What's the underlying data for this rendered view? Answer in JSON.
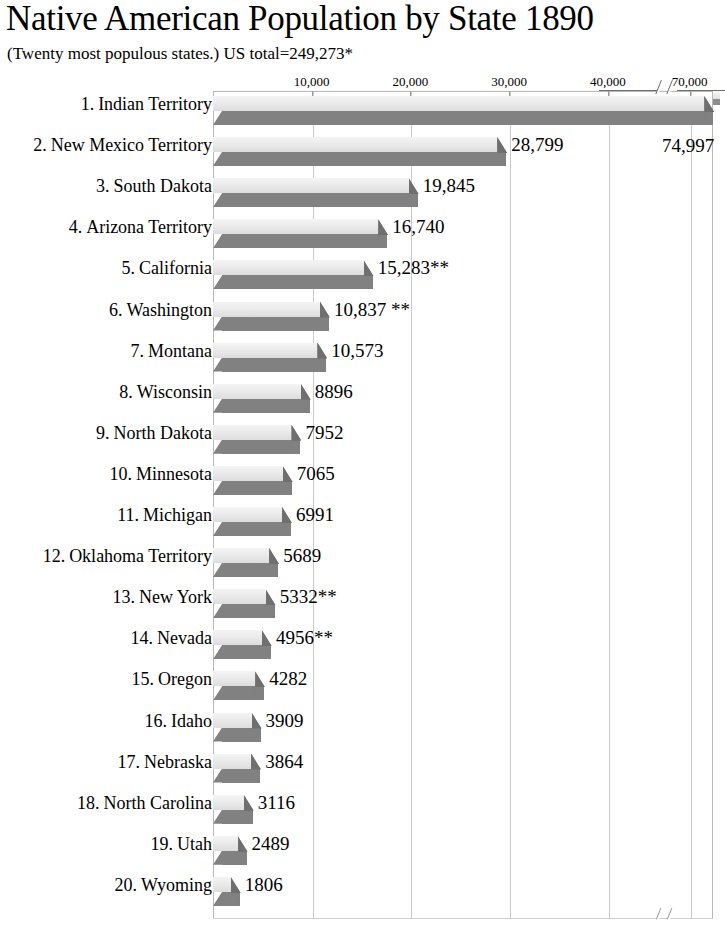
{
  "header": {
    "title": "Native American Population by State 1890",
    "subtitle": "(Twenty most populous states.) US total=249,273*"
  },
  "footnote": "",
  "axis": {
    "tick_labels": [
      "10,000",
      "20,000",
      "30,000",
      "40,000",
      "70,000"
    ],
    "break_present": true
  },
  "colors": {
    "bar_top": "#ebebeb",
    "bar_shadow": "#818181",
    "gridline": "#c9c9c9",
    "frame": "#b9b9b9",
    "text": "#000000"
  },
  "chart_data": {
    "type": "bar",
    "title": "Native American Population by State 1890",
    "subtitle": "(Twenty most populous states.) US total=249,273*",
    "orientation": "horizontal",
    "xlabel": "",
    "ylabel": "",
    "xlim": [
      0,
      80000
    ],
    "grid": true,
    "legend": "none",
    "axis_break": {
      "after": 45000,
      "before": 65000
    },
    "xticks": [
      10000,
      20000,
      30000,
      40000,
      70000
    ],
    "xticklabels": [
      "10,000",
      "20,000",
      "30,000",
      "40,000",
      "70,000"
    ],
    "categories": [
      "1. Indian Territory",
      "2. New Mexico Territory",
      "3. South Dakota",
      "4. Arizona Territory",
      "5. California",
      "6. Washington",
      "7. Montana",
      "8. Wisconsin",
      "9. North Dakota",
      "10. Minnesota",
      "11. Michigan",
      "12. Oklahoma Territory",
      "13. New York",
      "14. Nevada",
      "15. Oregon",
      "16. Idaho",
      "17. Nebraska",
      "18. North Carolina",
      "19. Utah",
      "20. Wyoming"
    ],
    "values": [
      74997,
      28799,
      19845,
      16740,
      15283,
      10837,
      10573,
      8896,
      7952,
      7065,
      6991,
      5689,
      5332,
      4956,
      4282,
      3909,
      3864,
      3116,
      2489,
      1806
    ],
    "value_labels": [
      "74,997",
      "28,799",
      "19,845",
      "16,740",
      "15,283**",
      "10,837 **",
      "10,573",
      "8896",
      "7952",
      "7065",
      "6991",
      "5689",
      "5332**",
      "4956**",
      "4282",
      "3909",
      "3864",
      "3116",
      "2489",
      "1806"
    ]
  },
  "rows": [
    {
      "rank": "1.",
      "state": "Indian Territory",
      "label": "1. Indian Territory",
      "value": 74997,
      "value_label": "74,997"
    },
    {
      "rank": "2.",
      "state": "New Mexico Territory",
      "label": "2. New Mexico Territory",
      "value": 28799,
      "value_label": "28,799"
    },
    {
      "rank": "3.",
      "state": "South Dakota",
      "label": "3. South Dakota",
      "value": 19845,
      "value_label": "19,845"
    },
    {
      "rank": "4.",
      "state": "Arizona Territory",
      "label": "4. Arizona Territory",
      "value": 16740,
      "value_label": "16,740"
    },
    {
      "rank": "5.",
      "state": "California",
      "label": "5. California",
      "value": 15283,
      "value_label": "15,283**"
    },
    {
      "rank": "6.",
      "state": "Washington",
      "label": "6. Washington",
      "value": 10837,
      "value_label": "10,837 **"
    },
    {
      "rank": "7.",
      "state": "Montana",
      "label": "7. Montana",
      "value": 10573,
      "value_label": "10,573"
    },
    {
      "rank": "8.",
      "state": "Wisconsin",
      "label": "8. Wisconsin",
      "value": 8896,
      "value_label": "8896"
    },
    {
      "rank": "9.",
      "state": "North Dakota",
      "label": "9. North Dakota",
      "value": 7952,
      "value_label": "7952"
    },
    {
      "rank": "10.",
      "state": "Minnesota",
      "label": "10. Minnesota",
      "value": 7065,
      "value_label": "7065"
    },
    {
      "rank": "11.",
      "state": "Michigan",
      "label": "11. Michigan",
      "value": 6991,
      "value_label": "6991"
    },
    {
      "rank": "12.",
      "state": "Oklahoma Territory",
      "label": "12. Oklahoma Territory",
      "value": 5689,
      "value_label": "5689"
    },
    {
      "rank": "13.",
      "state": "New York",
      "label": "13. New York",
      "value": 5332,
      "value_label": "5332**"
    },
    {
      "rank": "14.",
      "state": "Nevada",
      "label": "14. Nevada",
      "value": 4956,
      "value_label": "4956**"
    },
    {
      "rank": "15.",
      "state": "Oregon",
      "label": "15. Oregon",
      "value": 4282,
      "value_label": "4282"
    },
    {
      "rank": "16.",
      "state": "Idaho",
      "label": "16. Idaho",
      "value": 3909,
      "value_label": "3909"
    },
    {
      "rank": "17.",
      "state": "Nebraska",
      "label": "17. Nebraska",
      "value": 3864,
      "value_label": "3864"
    },
    {
      "rank": "18.",
      "state": "North Carolina",
      "label": "18. North Carolina",
      "value": 3116,
      "value_label": "3116"
    },
    {
      "rank": "19.",
      "state": "Utah",
      "label": "19. Utah",
      "value": 2489,
      "value_label": "2489"
    },
    {
      "rank": "20.",
      "state": "Wyoming",
      "label": "20. Wyoming",
      "value": 1806,
      "value_label": "1806"
    }
  ]
}
